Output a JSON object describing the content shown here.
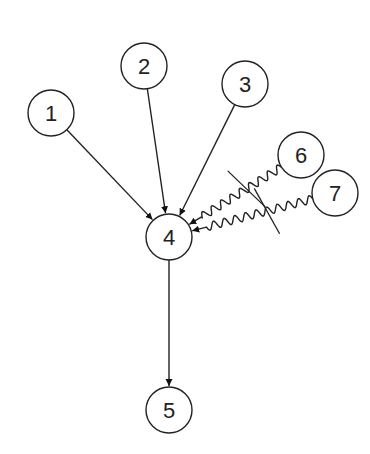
{
  "diagram": {
    "type": "directed-graph",
    "stroke_color": "#222222",
    "background": "#ffffff",
    "node_radius": 23,
    "nodes": [
      {
        "id": "1",
        "label": "1",
        "x": 51,
        "y": 113
      },
      {
        "id": "2",
        "label": "2",
        "x": 144,
        "y": 66
      },
      {
        "id": "3",
        "label": "3",
        "x": 245,
        "y": 84
      },
      {
        "id": "4",
        "label": "4",
        "x": 169,
        "y": 237
      },
      {
        "id": "5",
        "label": "5",
        "x": 169,
        "y": 410
      },
      {
        "id": "6",
        "label": "6",
        "x": 301,
        "y": 155
      },
      {
        "id": "7",
        "label": "7",
        "x": 335,
        "y": 193
      }
    ],
    "edges": [
      {
        "from": "1",
        "to": "4",
        "style": "straight"
      },
      {
        "from": "2",
        "to": "4",
        "style": "straight"
      },
      {
        "from": "3",
        "to": "4",
        "style": "straight"
      },
      {
        "from": "6",
        "to": "4",
        "style": "wavy",
        "cut": true
      },
      {
        "from": "7",
        "to": "4",
        "style": "wavy",
        "cut": true
      },
      {
        "from": "4",
        "to": "5",
        "style": "straight"
      }
    ]
  }
}
